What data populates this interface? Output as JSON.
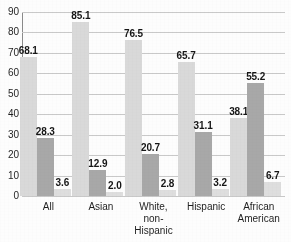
{
  "chart_data": {
    "type": "bar",
    "title": "",
    "xlabel": "",
    "ylabel": "",
    "ylim": [
      0,
      90
    ],
    "ytick_step": 10,
    "yticks": [
      "90",
      "80",
      "70",
      "60",
      "50",
      "40",
      "30",
      "20",
      "10",
      "0"
    ],
    "grid": true,
    "legend": "none",
    "categories": [
      "All",
      "Asian",
      "White,\nnon-Hispanic",
      "Hispanic",
      "African\nAmerican"
    ],
    "series": [
      {
        "name": "series-1",
        "color": "#d9d9d9",
        "values": [
          68.1,
          85.1,
          76.5,
          65.7,
          38.1
        ],
        "labels": [
          "68.1",
          "85.1",
          "76.5",
          "65.7",
          "38.1"
        ]
      },
      {
        "name": "series-2",
        "color": "#a8a8a8",
        "values": [
          28.3,
          12.9,
          20.7,
          31.1,
          55.2
        ],
        "labels": [
          "28.3",
          "12.9",
          "20.7",
          "31.1",
          "55.2"
        ]
      },
      {
        "name": "series-3",
        "color": "#dedede",
        "values": [
          3.6,
          2.0,
          2.8,
          3.2,
          6.7
        ],
        "labels": [
          "3.6",
          "2.0",
          "2.8",
          "3.2",
          "6.7"
        ]
      }
    ]
  },
  "colors": {
    "axis": "#8a8a8a",
    "grid": "#c9c9c9",
    "text": "#1f1f1f",
    "value_text": "#161616",
    "background": "#fdfdfd"
  }
}
